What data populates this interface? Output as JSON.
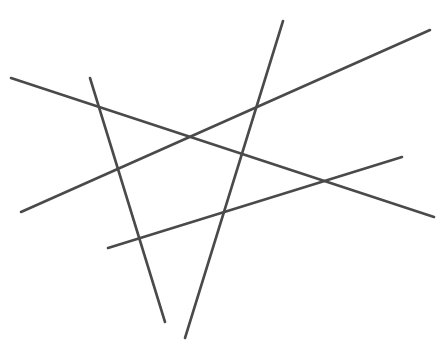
{
  "figure": {
    "width": 448,
    "height": 345,
    "background_color": "#ffffff",
    "stroke_color": "#4a4a4a",
    "stroke_width": 2.6,
    "segment_count": 5,
    "segments": [
      {
        "id": "segment-1",
        "name": "descending-long-line",
        "description": "Long line from upper-left to lower-right",
        "x1": 11,
        "y1": 78,
        "x2": 434,
        "y2": 217,
        "color": "#4a4a4a",
        "width": 2.6
      },
      {
        "id": "segment-2",
        "name": "ascending-long-line",
        "description": "Long line from lower-left to upper-right",
        "x1": 21,
        "y1": 212,
        "x2": 430,
        "y2": 30,
        "color": "#4a4a4a",
        "width": 2.6
      },
      {
        "id": "segment-3",
        "name": "steep-left-line",
        "description": "Steep line from upper-left down to bottom-center",
        "x1": 90,
        "y1": 78,
        "x2": 165,
        "y2": 322,
        "color": "#4a4a4a",
        "width": 2.6
      },
      {
        "id": "segment-4",
        "name": "steep-right-line",
        "description": "Steep line from top-center down to bottom-center-left",
        "x1": 283,
        "y1": 21,
        "x2": 185,
        "y2": 338,
        "color": "#4a4a4a",
        "width": 2.6
      },
      {
        "id": "segment-5",
        "name": "shallow-ascending-line",
        "description": "Shallow line from lower-left to middle-right",
        "x1": 108,
        "y1": 248,
        "x2": 402,
        "y2": 157,
        "color": "#4a4a4a",
        "width": 2.6
      }
    ],
    "intersections": [
      {
        "name": "intersection-upper-left",
        "x": 96,
        "y": 100
      },
      {
        "name": "intersection-center",
        "x": 192,
        "y": 140
      },
      {
        "name": "intersection-upper-right",
        "x": 262,
        "y": 112
      },
      {
        "name": "intersection-mid-left",
        "x": 120,
        "y": 177
      },
      {
        "name": "intersection-mid-right",
        "x": 233,
        "y": 175
      },
      {
        "name": "intersection-lower-center",
        "x": 145,
        "y": 257
      },
      {
        "name": "intersection-lower-right",
        "x": 222,
        "y": 219
      },
      {
        "name": "intersection-right",
        "x": 328,
        "y": 180
      }
    ]
  }
}
